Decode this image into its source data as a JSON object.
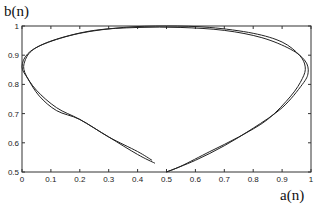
{
  "chart_data": {
    "type": "line",
    "title": "",
    "xlabel": "a(n)",
    "ylabel": "b(n)",
    "xlim": [
      0,
      1
    ],
    "ylim": [
      0.5,
      1
    ],
    "grid": false,
    "xticks": [
      "0",
      "0.1",
      "0.2",
      "0.3",
      "0.4",
      "0.5",
      "0.6",
      "0.7",
      "0.8",
      "0.9",
      "1"
    ],
    "yticks": [
      "0.5",
      "0.6",
      "0.7",
      "0.8",
      "0.9",
      "1"
    ],
    "series": [
      {
        "name": "trajectory-1",
        "x": [
          0.46,
          0.4,
          0.3,
          0.2,
          0.12,
          0.05,
          0.01,
          0.01,
          0.04,
          0.12,
          0.25,
          0.4,
          0.55,
          0.7,
          0.83,
          0.93,
          0.98,
          0.99,
          0.97,
          0.9,
          0.8,
          0.7,
          0.6,
          0.5
        ],
        "y": [
          0.53,
          0.56,
          0.62,
          0.68,
          0.72,
          0.78,
          0.84,
          0.88,
          0.92,
          0.955,
          0.985,
          0.995,
          0.995,
          0.985,
          0.96,
          0.92,
          0.88,
          0.84,
          0.8,
          0.72,
          0.65,
          0.59,
          0.54,
          0.5
        ]
      },
      {
        "name": "trajectory-2",
        "x": [
          0.45,
          0.4,
          0.3,
          0.2,
          0.12,
          0.06,
          0.02,
          0.0,
          0.02,
          0.08,
          0.2,
          0.35,
          0.5,
          0.65,
          0.8,
          0.9,
          0.96,
          0.98,
          0.97,
          0.93,
          0.85,
          0.75,
          0.65,
          0.55,
          0.5
        ],
        "y": [
          0.54,
          0.57,
          0.62,
          0.68,
          0.71,
          0.76,
          0.82,
          0.86,
          0.905,
          0.94,
          0.975,
          0.995,
          1.0,
          0.995,
          0.975,
          0.945,
          0.9,
          0.86,
          0.82,
          0.76,
          0.68,
          0.62,
          0.57,
          0.52,
          0.5
        ]
      }
    ]
  }
}
